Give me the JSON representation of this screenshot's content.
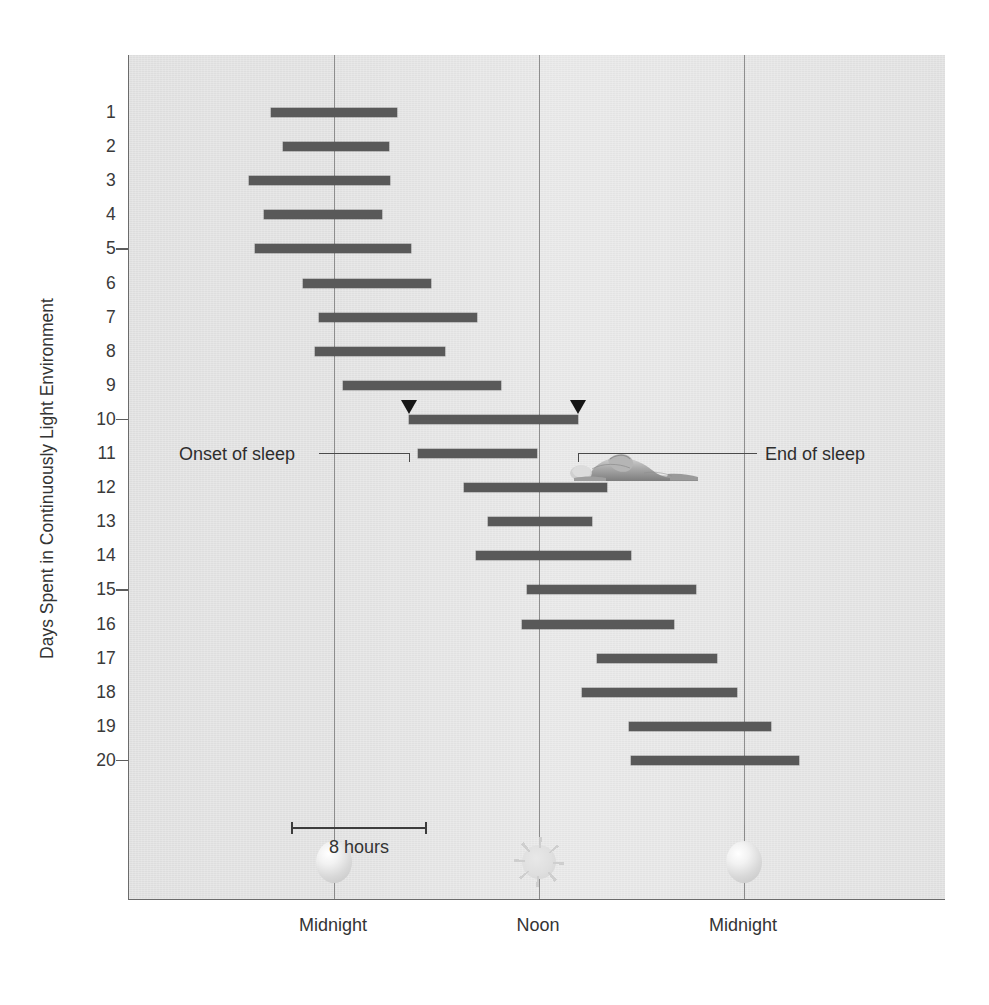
{
  "figure": {
    "kind": "actogram",
    "ylabel": "Days Spent in Continuously Light Environment",
    "scale_bar_label": "8 hours",
    "annotations": {
      "onset": "Onset of sleep",
      "end": "End of sleep"
    },
    "icons": {
      "moon_left": "moon-icon",
      "sun": "sun-icon",
      "moon_right": "moon-icon",
      "sleeper": "sleeping-person-illustration"
    }
  },
  "chart_data": {
    "type": "bar",
    "orientation": "horizontal",
    "title": "",
    "subtitle": "",
    "xlabel": "",
    "ylabel": "Days Spent in Continuously Light Environment",
    "xlim": [
      -5.5,
      42.5
    ],
    "ylim": [
      0.5,
      20.5
    ],
    "grid": true,
    "legend": null,
    "x_tick_labels": [
      "Midnight",
      "Noon",
      "Midnight"
    ],
    "x_tick_hours": [
      0,
      12,
      24
    ],
    "x_axis_unit": "hours of clock time",
    "scale_bar_hours": 8,
    "annotations": [
      {
        "label": "Onset of sleep",
        "day": 10,
        "hour": 4.4
      },
      {
        "label": "End of sleep",
        "day": 10,
        "hour": 14.3
      }
    ],
    "categories": [
      1,
      2,
      3,
      4,
      5,
      6,
      7,
      8,
      9,
      10,
      11,
      12,
      13,
      14,
      15,
      16,
      17,
      18,
      19,
      20
    ],
    "series": [
      {
        "name": "Sleep episode",
        "unit": "clock hour",
        "bars": [
          {
            "day": 1,
            "start": -3.7,
            "end": 3.7
          },
          {
            "day": 2,
            "start": -3.0,
            "end": 3.2
          },
          {
            "day": 3,
            "start": -5.0,
            "end": 3.3
          },
          {
            "day": 4,
            "start": -4.1,
            "end": 2.8
          },
          {
            "day": 5,
            "start": -4.6,
            "end": 4.5
          },
          {
            "day": 6,
            "start": -1.8,
            "end": 5.7
          },
          {
            "day": 7,
            "start": -0.9,
            "end": 8.4
          },
          {
            "day": 8,
            "start": -1.1,
            "end": 6.5
          },
          {
            "day": 9,
            "start": 0.5,
            "end": 9.8
          },
          {
            "day": 10,
            "start": 4.4,
            "end": 14.3
          },
          {
            "day": 11,
            "start": 4.9,
            "end": 11.9
          },
          {
            "day": 12,
            "start": 7.6,
            "end": 16.0
          },
          {
            "day": 13,
            "start": 9.0,
            "end": 15.1
          },
          {
            "day": 14,
            "start": 8.3,
            "end": 17.4
          },
          {
            "day": 15,
            "start": 11.3,
            "end": 21.2
          },
          {
            "day": 16,
            "start": 11.0,
            "end": 19.9
          },
          {
            "day": 17,
            "start": 15.4,
            "end": 22.4
          },
          {
            "day": 18,
            "start": 14.5,
            "end": 23.6
          },
          {
            "day": 19,
            "start": 17.3,
            "end": 25.6
          },
          {
            "day": 20,
            "start": 17.4,
            "end": 27.2
          }
        ]
      }
    ],
    "y_tick_marks": [
      5,
      10,
      15,
      20
    ],
    "colors": {
      "bar": "#595959",
      "plot_background": "#eaeaea",
      "gridline": "#8e8e8e",
      "axis": "#6b6b6b",
      "text": "#343434"
    }
  }
}
